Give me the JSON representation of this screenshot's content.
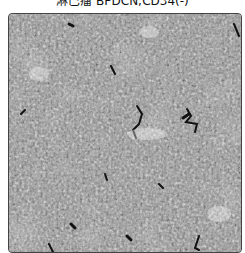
{
  "figure": {
    "title": "淋巴瘤 BPDCN;CD34(-)",
    "image_alt": "Grayscale histology micrograph of densely packed cells with scattered dark stained vessels"
  }
}
